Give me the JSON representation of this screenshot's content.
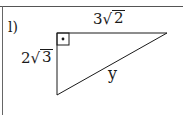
{
  "problem": {
    "label": "l)",
    "figure": "right-triangle",
    "right_angle_marker": "box-with-dot",
    "sides": {
      "top": {
        "coefficient": "3",
        "radical_symbol": "√",
        "radicand": "2"
      },
      "left": {
        "coefficient": "2",
        "radical_symbol": "√",
        "radicand": "3"
      },
      "hypotenuse": {
        "variable": "y"
      }
    }
  },
  "colors": {
    "line": "#1a1a1a",
    "frame": "#555555",
    "background": "#ffffff"
  }
}
